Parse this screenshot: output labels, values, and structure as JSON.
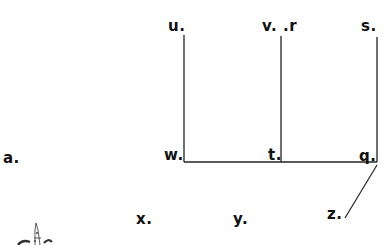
{
  "diagram": {
    "type": "dot-label line worksheet",
    "labels": [
      {
        "id": "u",
        "text": "u.",
        "x": 168,
        "y": 19
      },
      {
        "id": "v",
        "text": "v. .r",
        "x": 262,
        "y": 19
      },
      {
        "id": "s",
        "text": "s.",
        "x": 361,
        "y": 19
      },
      {
        "id": "a",
        "text": "a.",
        "x": 3,
        "y": 151
      },
      {
        "id": "w",
        "text": "w.",
        "x": 164,
        "y": 148
      },
      {
        "id": "t",
        "text": "t.",
        "x": 268,
        "y": 148
      },
      {
        "id": "q",
        "text": "q.",
        "x": 359,
        "y": 149
      },
      {
        "id": "x",
        "text": "x.",
        "x": 136,
        "y": 212
      },
      {
        "id": "y",
        "text": "y.",
        "x": 233,
        "y": 212
      },
      {
        "id": "z",
        "text": "z.",
        "x": 327,
        "y": 207
      }
    ],
    "lines": [
      {
        "from": "u",
        "to": "w",
        "x1": 184,
        "y1": 35,
        "x2": 184,
        "y2": 162
      },
      {
        "from": "r",
        "to": "t",
        "x1": 281,
        "y1": 36,
        "x2": 281,
        "y2": 162
      },
      {
        "from": "s",
        "to": "q",
        "x1": 377,
        "y1": 37,
        "x2": 377,
        "y2": 162
      },
      {
        "from": "w",
        "to": "q",
        "x1": 184,
        "y1": 162,
        "x2": 377,
        "y2": 162
      },
      {
        "from": "q",
        "to": "z",
        "x1": 377,
        "y1": 165,
        "x2": 345,
        "y2": 218
      }
    ],
    "line_color": "#222222",
    "text_color": "#111111",
    "partial_figure": "pointed-hat-drawing"
  }
}
